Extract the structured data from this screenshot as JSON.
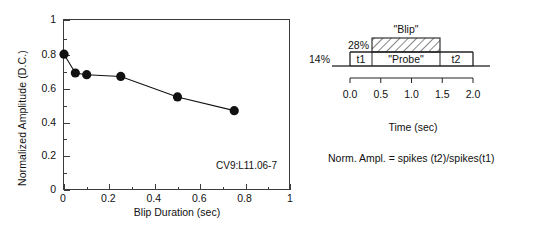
{
  "chart_data": {
    "type": "line",
    "title": "",
    "xlabel": "Blip Duration (sec)",
    "ylabel": "Normalized Amplitude (D.C.)",
    "xlim": [
      0,
      1
    ],
    "ylim": [
      0,
      1
    ],
    "grid": false,
    "legend": "none",
    "marker": "filled-circle",
    "annotation": "CV9:L11.06-7",
    "x": [
      0.0,
      0.05,
      0.1,
      0.25,
      0.5,
      0.75
    ],
    "values": [
      0.8,
      0.69,
      0.68,
      0.67,
      0.55,
      0.47
    ],
    "xticks": [
      0,
      0.2,
      0.4,
      0.6,
      0.8,
      1
    ],
    "xtick_labels": [
      "0",
      "0.2",
      "0.4",
      "0.6",
      "0.8",
      "1"
    ],
    "xticks_minor": [
      0.1,
      0.3,
      0.5,
      0.7,
      0.9
    ],
    "yticks": [
      0,
      0.2,
      0.4,
      0.6,
      0.8,
      1
    ],
    "ytick_labels": [
      "0",
      "0.2",
      "0.4",
      "0.6",
      "0.8",
      "1"
    ],
    "yticks_minor": [
      0.1,
      0.3,
      0.5,
      0.7,
      0.9
    ]
  },
  "stimulus_diagram": {
    "blip_label": "\"Blip\"",
    "blip_amplitude": "28%",
    "baseline_amplitude": "14%",
    "segments": [
      {
        "label": "t1"
      },
      {
        "label": "\"Probe\""
      },
      {
        "label": "t2"
      }
    ],
    "time_axis": {
      "label": "Time (sec)",
      "ticks": [
        "0.0",
        "0.5",
        "1.0",
        "1.5",
        "2.0"
      ]
    },
    "equation": "Norm. Ampl. = spikes (t2)/spikes(t1)"
  }
}
